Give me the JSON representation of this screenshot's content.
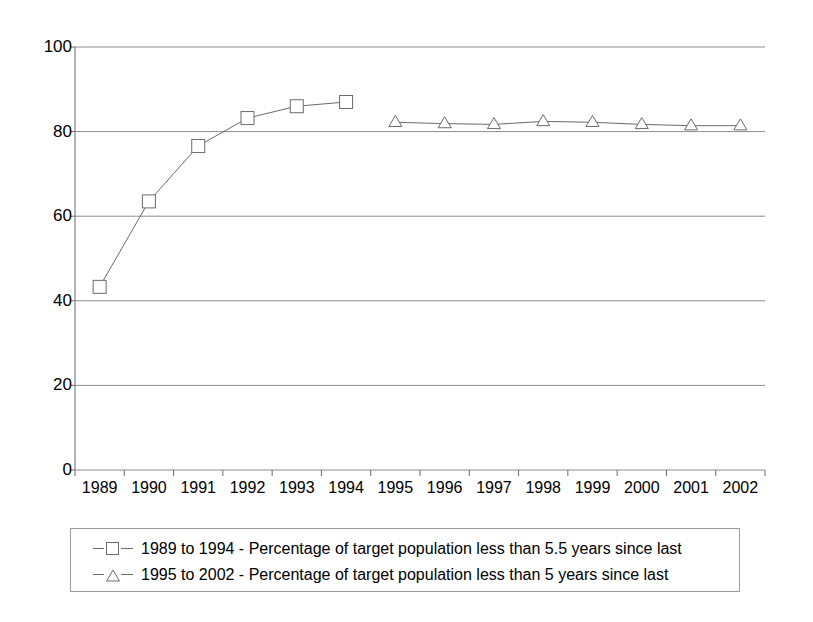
{
  "chart_data": {
    "type": "line",
    "title": "",
    "xlabel": "",
    "ylabel": "",
    "ylim": [
      0,
      100
    ],
    "y_ticks": [
      0,
      20,
      40,
      60,
      80,
      100
    ],
    "y_tick_labels": [
      "0",
      "20",
      "40",
      "60",
      "80",
      "100"
    ],
    "grid": "horizontal",
    "legend_position": "bottom",
    "categories": [
      "1989",
      "1990",
      "1991",
      "1992",
      "1993",
      "1994",
      "1995",
      "1996",
      "1997",
      "1998",
      "1999",
      "2000",
      "2001",
      "2002"
    ],
    "series": [
      {
        "name": "1989 to 1994 - Percentage of target population less than 5.5 years since last",
        "marker": "square",
        "color": "#6b6b6b",
        "x": [
          "1989",
          "1990",
          "1991",
          "1992",
          "1993",
          "1994"
        ],
        "values": [
          43.3,
          63.5,
          76.6,
          83.2,
          86.0,
          87.0
        ]
      },
      {
        "name": "1995 to 2002 - Percentage of target population less than 5 years since last",
        "marker": "triangle",
        "color": "#6b6b6b",
        "x": [
          "1995",
          "1996",
          "1997",
          "1998",
          "1999",
          "2000",
          "2001",
          "2002"
        ],
        "values": [
          82.2,
          81.9,
          81.7,
          82.4,
          82.2,
          81.7,
          81.4,
          81.4
        ]
      }
    ]
  },
  "axis": {
    "y_labels": [
      "100",
      "80",
      "60",
      "40",
      "20",
      "0"
    ],
    "x_labels": [
      "1989",
      "1990",
      "1991",
      "1992",
      "1993",
      "1994",
      "1995",
      "1996",
      "1997",
      "1998",
      "1999",
      "2000",
      "2001",
      "2002"
    ]
  },
  "legend": {
    "entries": [
      {
        "label": "1989 to 1994 - Percentage of target population less than 5.5 years since last",
        "marker": "square-marker-icon"
      },
      {
        "label": "1995 to 2002 - Percentage of target population less than 5 years since last",
        "marker": "triangle-marker-icon"
      }
    ]
  },
  "colors": {
    "line": "#6b6b6b",
    "grid": "#8c8c8c",
    "axis": "#6b6b6b",
    "text": "#000000",
    "background": "#ffffff"
  }
}
